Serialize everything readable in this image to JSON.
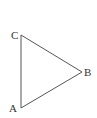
{
  "diagram": {
    "type": "triangle",
    "colors": {
      "edge": "#555555",
      "label": "#333333",
      "background": "#ffffff"
    },
    "vertices": [
      {
        "label": "A",
        "x": 21,
        "y": 108
      },
      {
        "label": "B",
        "x": 82,
        "y": 72
      },
      {
        "label": "C",
        "x": 21,
        "y": 35
      }
    ],
    "edges": [
      {
        "from": "A",
        "to": "B"
      },
      {
        "from": "B",
        "to": "C"
      },
      {
        "from": "C",
        "to": "A"
      }
    ],
    "labels": {
      "A": "A",
      "B": "B",
      "C": "C"
    }
  }
}
